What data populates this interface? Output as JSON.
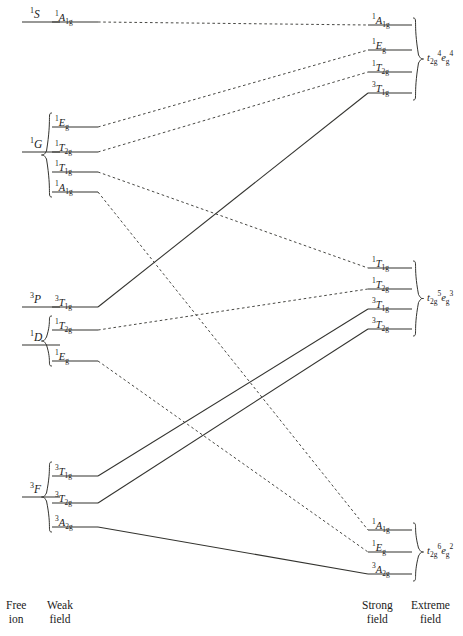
{
  "figure": {
    "type": "correlation-diagram",
    "columns": [
      "Free ion",
      "Weak field",
      "Strong field",
      "Extreme field"
    ]
  },
  "axis": {
    "free_ion": {
      "line1": "Free",
      "line2": "ion"
    },
    "weak_field": {
      "line1": "Weak",
      "line2": "field"
    },
    "strong_field": {
      "line1": "Strong",
      "line2": "field"
    },
    "extreme_field": {
      "line1": "Extreme",
      "line2": "field"
    }
  },
  "free_ion_terms": [
    {
      "id": "S1",
      "mult": "1",
      "letter": "S",
      "y": 22
    },
    {
      "id": "G1",
      "mult": "1",
      "letter": "G",
      "y": 152
    },
    {
      "id": "P3",
      "mult": "3",
      "letter": "P",
      "y": 307
    },
    {
      "id": "D1",
      "mult": "1",
      "letter": "D",
      "y": 345
    },
    {
      "id": "F3",
      "mult": "3",
      "letter": "F",
      "y": 497
    }
  ],
  "weak_field_states": [
    {
      "id": "w1",
      "mult": "1",
      "sym": "A",
      "sub": "1g",
      "y": 22,
      "parent": "S1",
      "spin": "singlet"
    },
    {
      "id": "w2",
      "mult": "1",
      "sym": "E",
      "sub": "g",
      "y": 127,
      "parent": "G1",
      "spin": "singlet"
    },
    {
      "id": "w3",
      "mult": "1",
      "sym": "T",
      "sub": "2g",
      "y": 152,
      "parent": "G1",
      "spin": "singlet"
    },
    {
      "id": "w4",
      "mult": "1",
      "sym": "T",
      "sub": "1g",
      "y": 172,
      "parent": "G1",
      "spin": "singlet"
    },
    {
      "id": "w5",
      "mult": "1",
      "sym": "A",
      "sub": "1g",
      "y": 192,
      "parent": "G1",
      "spin": "singlet"
    },
    {
      "id": "w6",
      "mult": "3",
      "sym": "T",
      "sub": "1g",
      "y": 307,
      "parent": "P3",
      "spin": "triplet"
    },
    {
      "id": "w7",
      "mult": "1",
      "sym": "T",
      "sub": "2g",
      "y": 330,
      "parent": "D1",
      "spin": "singlet"
    },
    {
      "id": "w8",
      "mult": "1",
      "sym": "E",
      "sub": "g",
      "y": 361,
      "parent": "D1",
      "spin": "singlet"
    },
    {
      "id": "w9",
      "mult": "3",
      "sym": "T",
      "sub": "1g",
      "y": 476,
      "parent": "F3",
      "spin": "triplet"
    },
    {
      "id": "w10",
      "mult": "3",
      "sym": "T",
      "sub": "2g",
      "y": 503,
      "parent": "F3",
      "spin": "triplet"
    },
    {
      "id": "w11",
      "mult": "3",
      "sym": "A",
      "sub": "2g",
      "y": 527,
      "parent": "F3",
      "spin": "triplet"
    }
  ],
  "strong_field_states": [
    {
      "id": "s1",
      "mult": "1",
      "sym": "A",
      "sub": "1g",
      "y": 25,
      "group": "cfg1",
      "spin": "singlet"
    },
    {
      "id": "s2",
      "mult": "1",
      "sym": "E",
      "sub": "g",
      "y": 50,
      "group": "cfg1",
      "spin": "singlet"
    },
    {
      "id": "s3",
      "mult": "1",
      "sym": "T",
      "sub": "2g",
      "y": 72,
      "group": "cfg1",
      "spin": "singlet"
    },
    {
      "id": "s4",
      "mult": "3",
      "sym": "T",
      "sub": "1g",
      "y": 93,
      "group": "cfg1",
      "spin": "triplet"
    },
    {
      "id": "s5",
      "mult": "1",
      "sym": "T",
      "sub": "1g",
      "y": 268,
      "group": "cfg2",
      "spin": "singlet"
    },
    {
      "id": "s6",
      "mult": "1",
      "sym": "T",
      "sub": "2g",
      "y": 289,
      "group": "cfg2",
      "spin": "singlet"
    },
    {
      "id": "s7",
      "mult": "3",
      "sym": "T",
      "sub": "1g",
      "y": 309,
      "group": "cfg2",
      "spin": "triplet"
    },
    {
      "id": "s8",
      "mult": "3",
      "sym": "T",
      "sub": "2g",
      "y": 329,
      "group": "cfg2",
      "spin": "triplet"
    },
    {
      "id": "s9",
      "mult": "1",
      "sym": "A",
      "sub": "1g",
      "y": 530,
      "group": "cfg3",
      "spin": "singlet"
    },
    {
      "id": "s10",
      "mult": "1",
      "sym": "E",
      "sub": "g",
      "y": 552,
      "group": "cfg3",
      "spin": "singlet"
    },
    {
      "id": "s11",
      "mult": "3",
      "sym": "A",
      "sub": "2g",
      "y": 574,
      "group": "cfg3",
      "spin": "triplet"
    }
  ],
  "configurations": [
    {
      "id": "cfg1",
      "t2g_sub": "2g",
      "t2g_sup": "4",
      "eg_sub": "g",
      "eg_sup": "4",
      "y_top": 18,
      "y_bot": 100,
      "y_label": 58
    },
    {
      "id": "cfg2",
      "t2g_sub": "2g",
      "t2g_sup": "5",
      "eg_sub": "g",
      "eg_sup": "3",
      "y_top": 261,
      "y_bot": 336,
      "y_label": 298
    },
    {
      "id": "cfg3",
      "t2g_sub": "2g",
      "t2g_sup": "6",
      "eg_sub": "g",
      "eg_sup": "2",
      "y_top": 523,
      "y_bot": 581,
      "y_label": 551
    }
  ],
  "correlations": [
    {
      "from": "w1",
      "to": "s1",
      "style": "dashed"
    },
    {
      "from": "w2",
      "to": "s2",
      "style": "dashed"
    },
    {
      "from": "w3",
      "to": "s3",
      "style": "dashed"
    },
    {
      "from": "w4",
      "to": "s5",
      "style": "dashed"
    },
    {
      "from": "w5",
      "to": "s9",
      "style": "dashed"
    },
    {
      "from": "w6",
      "to": "s4",
      "style": "solid"
    },
    {
      "from": "w7",
      "to": "s6",
      "style": "dashed"
    },
    {
      "from": "w8",
      "to": "s10",
      "style": "dashed"
    },
    {
      "from": "w9",
      "to": "s7",
      "style": "solid"
    },
    {
      "from": "w10",
      "to": "s8",
      "style": "solid"
    },
    {
      "from": "w11",
      "to": "s11",
      "style": "solid"
    }
  ],
  "colors": {
    "ink": "#1a1a1a",
    "line": "#33332f",
    "background": "#ffffff"
  }
}
